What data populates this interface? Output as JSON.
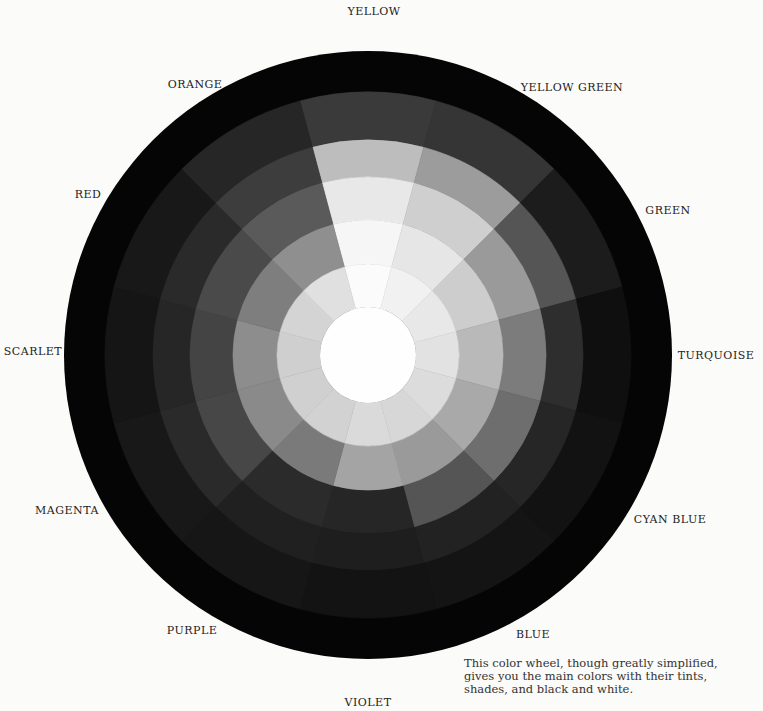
{
  "diagram": {
    "type": "color-wheel",
    "center": [
      368,
      355
    ],
    "outer_black_ring": {
      "outer_radius": 304,
      "inner_radius": 263,
      "color": "#050505"
    },
    "center_disc": {
      "radius": 48,
      "color": "#fefefe",
      "label": "white"
    },
    "ring_radii": [
      263,
      215,
      178,
      135,
      91,
      48
    ],
    "ring_names": [
      "dark shade",
      "shade",
      "deep shade",
      "pure hue",
      "tint"
    ],
    "segments": [
      {
        "name": "YELLOW",
        "angle": -90,
        "grays": [
          "#3a3a3a",
          "#bdbdbd",
          "#e8e8e8",
          "#f6f6f6",
          "#fbfbfb"
        ]
      },
      {
        "name": "YELLOW GREEN",
        "angle": -60,
        "grays": [
          "#353535",
          "#9c9c9c",
          "#cfcfcf",
          "#e6e6e6",
          "#f1f1f1"
        ]
      },
      {
        "name": "GREEN",
        "angle": -30,
        "grays": [
          "#1c1c1c",
          "#555555",
          "#9a9a9a",
          "#cdcdcd",
          "#e8e8e8"
        ]
      },
      {
        "name": "TURQUOISE",
        "angle": 0,
        "grays": [
          "#0f0f0f",
          "#2e2e2e",
          "#7c7c7c",
          "#b9b9b9",
          "#e2e2e2"
        ]
      },
      {
        "name": "CYAN BLUE",
        "angle": 30,
        "grays": [
          "#121212",
          "#262626",
          "#6e6e6e",
          "#a9a9a9",
          "#dcdcdc"
        ]
      },
      {
        "name": "BLUE",
        "angle": 60,
        "grays": [
          "#141414",
          "#222222",
          "#555555",
          "#9a9a9a",
          "#d7d7d7"
        ]
      },
      {
        "name": "VIOLET",
        "angle": 90,
        "grays": [
          "#131313",
          "#1e1e1e",
          "#262626",
          "#a4a4a4",
          "#dadada"
        ]
      },
      {
        "name": "PURPLE",
        "angle": 120,
        "grays": [
          "#161616",
          "#202020",
          "#2b2b2b",
          "#7a7a7a",
          "#d2d2d2"
        ]
      },
      {
        "name": "MAGENTA",
        "angle": 150,
        "grays": [
          "#181818",
          "#2a2a2a",
          "#474747",
          "#8a8a8a",
          "#d0d0d0"
        ]
      },
      {
        "name": "SCARLET",
        "angle": 180,
        "grays": [
          "#151515",
          "#262626",
          "#444444",
          "#8d8d8d",
          "#cfcfcf"
        ]
      },
      {
        "name": "RED",
        "angle": 210,
        "grays": [
          "#181818",
          "#2a2a2a",
          "#4a4a4a",
          "#7e7e7e",
          "#d4d4d4"
        ]
      },
      {
        "name": "ORANGE",
        "angle": 240,
        "grays": [
          "#262626",
          "#3d3d3d",
          "#5a5a5a",
          "#8f8f8f",
          "#e0e0e0"
        ]
      }
    ]
  },
  "labels": [
    {
      "text": "YELLOW",
      "x": 374,
      "y": 11
    },
    {
      "text": "YELLOW GREEN",
      "x": 572,
      "y": 87
    },
    {
      "text": "GREEN",
      "x": 668,
      "y": 210
    },
    {
      "text": "TURQUOISE",
      "x": 716,
      "y": 355
    },
    {
      "text": "CYAN BLUE",
      "x": 670,
      "y": 519
    },
    {
      "text": "BLUE",
      "x": 533,
      "y": 634
    },
    {
      "text": "VIOLET",
      "x": 368,
      "y": 702
    },
    {
      "text": "PURPLE",
      "x": 192,
      "y": 630
    },
    {
      "text": "MAGENTA",
      "x": 67,
      "y": 510
    },
    {
      "text": "SCARLET",
      "x": 33,
      "y": 351
    },
    {
      "text": "RED",
      "x": 88,
      "y": 194
    },
    {
      "text": "ORANGE",
      "x": 195,
      "y": 84
    }
  ],
  "caption": "This color wheel, though greatly simplified, gives you the main colors with their tints, shades, and black and white."
}
